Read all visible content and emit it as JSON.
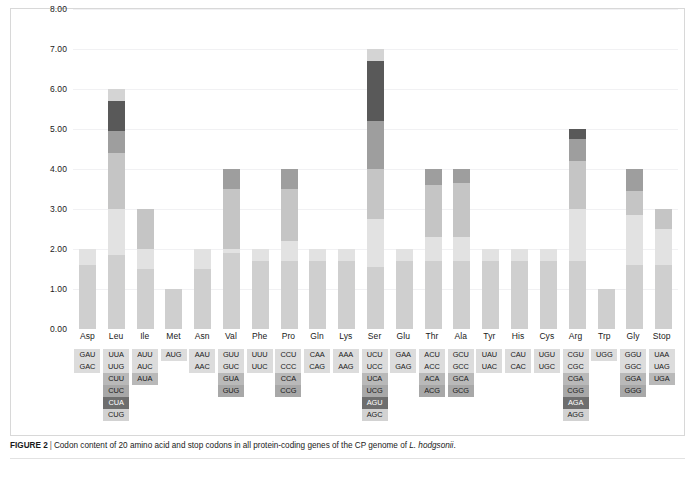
{
  "caption": {
    "figure_label": "FIGURE 2",
    "separator": "|",
    "text_before_italic": "Codon content of 20 amino acid and stop codons in all protein-coding genes of the CP genome of ",
    "italic_species": "L. hodgsonii",
    "text_after_italic": "."
  },
  "colors": {
    "seg1": "#cfcfcf",
    "seg2": "#e2e2e2",
    "seg3": "#c5c5c5",
    "seg4": "#9e9e9e",
    "seg5": "#595959",
    "seg6": "#d4d4d4",
    "codon_row1": "#dcdcdc",
    "codon_row2": "#dcdcdc",
    "codon_row3": "#b9b9b9",
    "codon_row4": "#a8a8a8",
    "codon_row5": "#6e6e6e",
    "codon_row6": "#d2d2d2",
    "gridline": "#f1f1f3",
    "frame": "#d8d8d8",
    "background": "#ffffff"
  },
  "chart_data": {
    "type": "bar",
    "title": "",
    "xlabel": "",
    "ylabel": "",
    "stacked": true,
    "ylim": [
      0,
      8
    ],
    "ytick_labels": [
      "0.00",
      "1.00",
      "2.00",
      "3.00",
      "4.00",
      "5.00",
      "6.00",
      "7.00",
      "8.00"
    ],
    "ytick_values": [
      0,
      1,
      2,
      3,
      4,
      5,
      6,
      7,
      8
    ],
    "grid": true,
    "legend": "none",
    "categories": [
      "Asp",
      "Leu",
      "Ile",
      "Met",
      "Asn",
      "Val",
      "Phe",
      "Pro",
      "Gln",
      "Lys",
      "Ser",
      "Glu",
      "Thr",
      "Ala",
      "Tyr",
      "His",
      "Cys",
      "Arg",
      "Trp",
      "Gly",
      "Stop"
    ],
    "totals": [
      2.0,
      6.0,
      3.0,
      1.0,
      2.0,
      4.0,
      2.0,
      4.0,
      2.0,
      2.0,
      7.0,
      2.0,
      4.0,
      4.0,
      2.0,
      2.0,
      2.0,
      5.0,
      1.0,
      4.0,
      3.0
    ],
    "stacks": [
      {
        "category": "Asp",
        "segments": [
          1.6,
          0.4
        ]
      },
      {
        "category": "Leu",
        "segments": [
          1.85,
          1.15,
          1.4,
          0.55,
          0.75,
          0.3
        ]
      },
      {
        "category": "Ile",
        "segments": [
          1.5,
          0.5,
          1.0
        ]
      },
      {
        "category": "Met",
        "segments": [
          1.0
        ]
      },
      {
        "category": "Asn",
        "segments": [
          1.5,
          0.5
        ]
      },
      {
        "category": "Val",
        "segments": [
          1.9,
          0.1,
          1.5,
          0.5
        ]
      },
      {
        "category": "Phe",
        "segments": [
          1.7,
          0.3
        ]
      },
      {
        "category": "Pro",
        "segments": [
          1.7,
          0.5,
          1.3,
          0.5
        ]
      },
      {
        "category": "Gln",
        "segments": [
          1.7,
          0.3
        ]
      },
      {
        "category": "Lys",
        "segments": [
          1.7,
          0.3
        ]
      },
      {
        "category": "Ser",
        "segments": [
          1.55,
          1.2,
          1.25,
          1.2,
          1.5,
          0.3
        ]
      },
      {
        "category": "Glu",
        "segments": [
          1.7,
          0.3
        ]
      },
      {
        "category": "Thr",
        "segments": [
          1.7,
          0.6,
          1.3,
          0.4
        ]
      },
      {
        "category": "Ala",
        "segments": [
          1.7,
          0.6,
          1.35,
          0.35
        ]
      },
      {
        "category": "Tyr",
        "segments": [
          1.7,
          0.3
        ]
      },
      {
        "category": "His",
        "segments": [
          1.7,
          0.3
        ]
      },
      {
        "category": "Cys",
        "segments": [
          1.7,
          0.3
        ]
      },
      {
        "category": "Arg",
        "segments": [
          1.7,
          1.3,
          1.2,
          0.55,
          0.25
        ]
      },
      {
        "category": "Trp",
        "segments": [
          1.0
        ]
      },
      {
        "category": "Gly",
        "segments": [
          1.6,
          1.25,
          0.6,
          0.55
        ]
      },
      {
        "category": "Stop",
        "segments": [
          1.6,
          0.9,
          0.5
        ]
      }
    ]
  },
  "codon_table": {
    "columns": [
      {
        "amino_acid": "Asp",
        "codons": [
          "GAU",
          "GAC",
          "",
          "",
          "",
          ""
        ]
      },
      {
        "amino_acid": "Leu",
        "codons": [
          "UUA",
          "UUG",
          "CUU",
          "CUC",
          "CUA",
          "CUG"
        ]
      },
      {
        "amino_acid": "Ile",
        "codons": [
          "AUU",
          "AUC",
          "AUA",
          "",
          "",
          ""
        ]
      },
      {
        "amino_acid": "Met",
        "codons": [
          "AUG",
          "",
          "",
          "",
          "",
          ""
        ]
      },
      {
        "amino_acid": "Asn",
        "codons": [
          "AAU",
          "AAC",
          "",
          "",
          "",
          ""
        ]
      },
      {
        "amino_acid": "Val",
        "codons": [
          "GUU",
          "GUC",
          "GUA",
          "GUG",
          "",
          ""
        ]
      },
      {
        "amino_acid": "Phe",
        "codons": [
          "UUU",
          "UUC",
          "",
          "",
          "",
          ""
        ]
      },
      {
        "amino_acid": "Pro",
        "codons": [
          "CCU",
          "CCC",
          "CCA",
          "CCG",
          "",
          ""
        ]
      },
      {
        "amino_acid": "Gln",
        "codons": [
          "CAA",
          "CAG",
          "",
          "",
          "",
          ""
        ]
      },
      {
        "amino_acid": "Lys",
        "codons": [
          "AAA",
          "AAG",
          "",
          "",
          "",
          ""
        ]
      },
      {
        "amino_acid": "Ser",
        "codons": [
          "UCU",
          "UCC",
          "UCA",
          "UCG",
          "AGU",
          "AGC"
        ]
      },
      {
        "amino_acid": "Glu",
        "codons": [
          "GAA",
          "GAG",
          "",
          "",
          "",
          ""
        ]
      },
      {
        "amino_acid": "Thr",
        "codons": [
          "ACU",
          "ACC",
          "ACA",
          "ACG",
          "",
          ""
        ]
      },
      {
        "amino_acid": "Ala",
        "codons": [
          "GCU",
          "GCC",
          "GCA",
          "GCG",
          "",
          ""
        ]
      },
      {
        "amino_acid": "Tyr",
        "codons": [
          "UAU",
          "UAC",
          "",
          "",
          "",
          ""
        ]
      },
      {
        "amino_acid": "His",
        "codons": [
          "CAU",
          "CAC",
          "",
          "",
          "",
          ""
        ]
      },
      {
        "amino_acid": "Cys",
        "codons": [
          "UGU",
          "UGC",
          "",
          "",
          "",
          ""
        ]
      },
      {
        "amino_acid": "Arg",
        "codons": [
          "CGU",
          "CGC",
          "CGA",
          "CGG",
          "AGA",
          "AGG"
        ]
      },
      {
        "amino_acid": "Trp",
        "codons": [
          "UGG",
          "",
          "",
          "",
          "",
          ""
        ]
      },
      {
        "amino_acid": "Gly",
        "codons": [
          "GGU",
          "GGC",
          "GGA",
          "GGG",
          "",
          ""
        ]
      },
      {
        "amino_acid": "Stop",
        "codons": [
          "UAA",
          "UAG",
          "UGA",
          "",
          "",
          ""
        ]
      }
    ]
  }
}
